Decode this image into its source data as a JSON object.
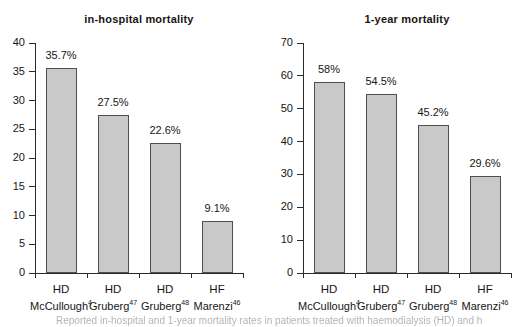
{
  "figure": {
    "caption_fragment": "Reported in-hospital and 1-year mortality rates in patients treated with haemodialysis (HD) and h"
  },
  "colors": {
    "bar_fill": "#c9c9c9",
    "bar_border": "#4f4f4f",
    "axis": "#2b2b2b",
    "text": "#1d1d1d"
  },
  "chart_data": [
    {
      "type": "bar",
      "title": "in-hospital mortality",
      "categories": [
        "HD",
        "HD",
        "HD",
        "HF"
      ],
      "studies": [
        {
          "name": "McCullough",
          "ref": "4"
        },
        {
          "name": "Gruberg",
          "ref": "47"
        },
        {
          "name": "Gruberg",
          "ref": "48"
        },
        {
          "name": "Marenzi",
          "ref": "46"
        }
      ],
      "values": [
        35.7,
        27.5,
        22.6,
        9.1
      ],
      "value_labels": [
        "35.7%",
        "27.5%",
        "22.6%",
        "9.1%"
      ],
      "xlabel": "",
      "ylabel": "",
      "ylim": [
        0,
        40
      ],
      "yticks": [
        0,
        5,
        10,
        15,
        20,
        25,
        30,
        35,
        40
      ],
      "grid": false,
      "legend": false
    },
    {
      "type": "bar",
      "title": "1-year mortality",
      "categories": [
        "HD",
        "HD",
        "HD",
        "HF"
      ],
      "studies": [
        {
          "name": "McCullough",
          "ref": "4"
        },
        {
          "name": "Gruberg",
          "ref": "47"
        },
        {
          "name": "Gruberg",
          "ref": "48"
        },
        {
          "name": "Marenzi",
          "ref": "46"
        }
      ],
      "values": [
        58,
        54.5,
        45.2,
        29.6
      ],
      "value_labels": [
        "58%",
        "54.5%",
        "45.2%",
        "29.6%"
      ],
      "xlabel": "",
      "ylabel": "",
      "ylim": [
        0,
        70
      ],
      "yticks": [
        0,
        10,
        20,
        30,
        40,
        50,
        60,
        70
      ],
      "grid": false,
      "legend": false
    }
  ]
}
